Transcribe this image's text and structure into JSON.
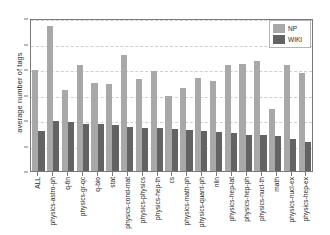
{
  "chart_data": {
    "type": "bar",
    "title": "",
    "xlabel": "",
    "ylabel": "average number of tags",
    "ylim": [
      0,
      30
    ],
    "yticks": [
      0,
      5,
      10,
      15,
      20,
      25,
      30
    ],
    "grid": true,
    "legend_position": "top-right",
    "colors": {
      "NP": "#a8a8a8",
      "WIKI": "#636363"
    },
    "categories": [
      "ALL",
      "physics-astro-ph",
      "q-fin",
      "physics-gr-qc",
      "q-bio",
      "stat",
      "physics-cond-mat",
      "physics-physics",
      "physics-hep-th",
      "cs",
      "physics-math-ph",
      "physics-quant-ph",
      "nlin",
      "physics-hep-lat",
      "physics-hep-ph",
      "physics-nucl-th",
      "math",
      "physics-nucl-ex",
      "physics-hep-ex"
    ],
    "series": [
      {
        "name": "NP",
        "values": [
          20.1,
          28.9,
          16.1,
          21.1,
          17.4,
          17.2,
          23.0,
          18.2,
          19.9,
          14.9,
          16.5,
          18.5,
          17.8,
          21.0,
          21.2,
          21.9,
          12.4,
          21.1,
          19.5
        ]
      },
      {
        "name": "WIKI",
        "values": [
          8.0,
          9.9,
          9.8,
          9.4,
          9.3,
          9.1,
          8.7,
          8.5,
          8.5,
          8.3,
          8.1,
          8.0,
          7.8,
          7.6,
          7.1,
          7.1,
          7.0,
          6.4,
          5.7
        ]
      }
    ],
    "legend": [
      "NP",
      "WIKI"
    ]
  }
}
